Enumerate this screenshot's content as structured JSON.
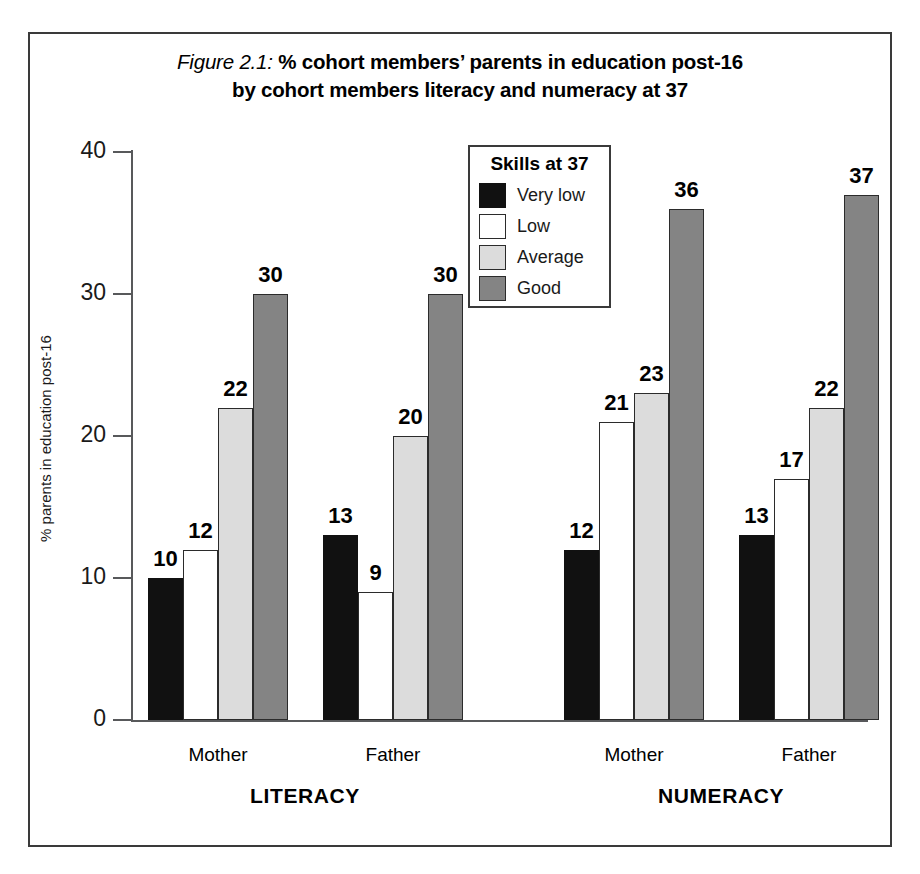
{
  "figure": {
    "title_prefix": "Figure 2.1:",
    "title_line1": " % cohort members’ parents in education post-16",
    "title_line2": "by cohort members literacy and numeracy at 37"
  },
  "legend": {
    "title": "Skills at 37",
    "entries": [
      {
        "label": "Very low",
        "color": "#111111"
      },
      {
        "label": "Low",
        "color": "#ffffff"
      },
      {
        "label": "Average",
        "color": "#dcdcdc"
      },
      {
        "label": "Good",
        "color": "#848484"
      }
    ]
  },
  "axes": {
    "y_title": "% parents in education post-16",
    "y_ticks": [
      "0",
      "10",
      "20",
      "30",
      "40"
    ],
    "x_subgroups": [
      "Mother",
      "Father",
      "Mother",
      "Father"
    ],
    "x_groups": [
      "LITERACY",
      "NUMERACY"
    ]
  },
  "chart_data": {
    "type": "bar",
    "title": "Figure 2.1: % cohort members’ parents in education post-16 by cohort members literacy and numeracy at 37",
    "xlabel": "",
    "ylabel": "% parents in education post-16",
    "ylim": [
      0,
      40
    ],
    "ytick_values": [
      0,
      10,
      20,
      30,
      40
    ],
    "grid": false,
    "legend_title": "Skills at 37",
    "legend_position": "inside-top-center",
    "categories": [
      "LITERACY Mother",
      "LITERACY Father",
      "NUMERACY Mother",
      "NUMERACY Father"
    ],
    "group_labels": [
      "LITERACY",
      "NUMERACY"
    ],
    "subgroup_labels": [
      "Mother",
      "Father",
      "Mother",
      "Father"
    ],
    "series": [
      {
        "name": "Very low",
        "color": "#111111",
        "values": [
          10,
          13,
          12,
          13
        ]
      },
      {
        "name": "Low",
        "color": "#ffffff",
        "values": [
          12,
          9,
          21,
          17
        ]
      },
      {
        "name": "Average",
        "color": "#dcdcdc",
        "values": [
          22,
          20,
          23,
          22
        ]
      },
      {
        "name": "Good",
        "color": "#848484",
        "values": [
          30,
          30,
          36,
          37
        ]
      }
    ],
    "bar_labels": [
      [
        "10",
        "12",
        "22",
        "30"
      ],
      [
        "13",
        "9",
        "20",
        "30"
      ],
      [
        "12",
        "21",
        "23",
        "36"
      ],
      [
        "13",
        "17",
        "22",
        "37"
      ]
    ]
  },
  "geometry": {
    "baseline_y": 720,
    "px_per_unit": 14.2,
    "bar_width": 35,
    "group_starts": [
      148,
      323,
      564,
      739
    ],
    "subgroup_centers": [
      218,
      393,
      634,
      809
    ],
    "group_centers": [
      305,
      721
    ]
  }
}
